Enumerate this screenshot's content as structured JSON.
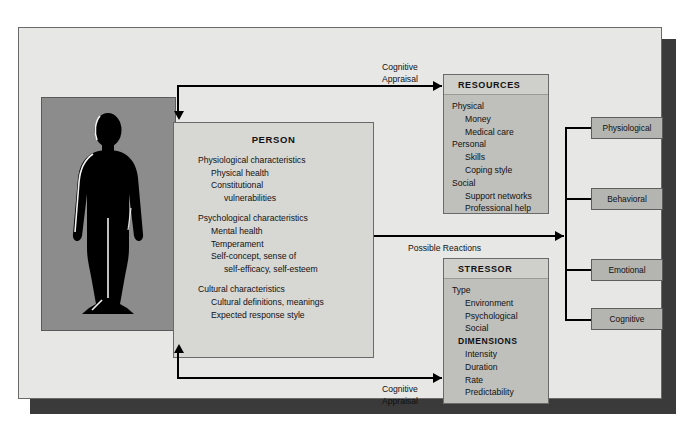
{
  "diagram": {
    "colors": {
      "panel_bg": "#e7e7e5",
      "person_bg": "#d7d7d4",
      "card_bg": "#bfbfbc",
      "card_head_bg": "#cfcfcb",
      "outcome_bg": "#b4b4b1",
      "silhouette_bg": "#8c8c8c",
      "silhouette_fill": "#000000",
      "line": "#000000",
      "shadow": "#3a3a3a"
    }
  },
  "silhouette": {
    "name": "human-figure-silhouette"
  },
  "person": {
    "title": "PERSON",
    "groups": [
      {
        "heading": "Physiological characteristics",
        "items": [
          "Physical health",
          "Constitutional"
        ],
        "items2": [
          "vulnerabilities"
        ]
      },
      {
        "heading": "Psychological characteristics",
        "items": [
          "Mental health",
          "Temperament",
          "Self-concept, sense of"
        ],
        "items2": [
          "self-efficacy, self-esteem"
        ]
      },
      {
        "heading": "Cultural characteristics",
        "items": [
          "Cultural definitions, meanings",
          "Expected response style"
        ],
        "items2": []
      }
    ]
  },
  "resources": {
    "title": "RESOURCES",
    "groups": [
      {
        "heading": "Physical",
        "items": [
          "Money",
          "Medical care"
        ]
      },
      {
        "heading": "Personal",
        "items": [
          "Skills",
          "Coping style"
        ]
      },
      {
        "heading": "Social",
        "items": [
          "Support networks",
          "Professional help"
        ]
      }
    ]
  },
  "stressor": {
    "title": "STRESSOR",
    "groups": [
      {
        "heading": "Type",
        "bold": false,
        "items": [
          "Environment",
          "Psychological",
          "Social"
        ]
      },
      {
        "heading": "DIMENSIONS",
        "bold": true,
        "items": [
          "Intensity",
          "Duration",
          "Rate",
          "Predictability"
        ]
      }
    ]
  },
  "outcomes": {
    "items": [
      {
        "label": "Physiological"
      },
      {
        "label": "Behavioral"
      },
      {
        "label": "Emotional"
      },
      {
        "label": "Cognitive"
      }
    ]
  },
  "edges": {
    "top_label": "Cognitive\nAppraisal",
    "bottom_label": "Cognitive\nAppraisal",
    "middle_label": "Possible Reactions"
  }
}
